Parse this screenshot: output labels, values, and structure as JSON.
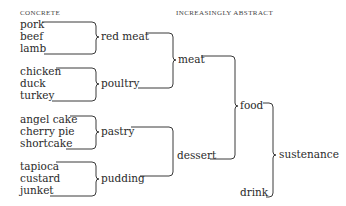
{
  "headers": {
    "left": "CONCRETE",
    "right": "INCREASINGLY ABSTRACT"
  },
  "level0": {
    "red_meat_items": [
      "pork",
      "beef",
      "lamb"
    ],
    "poultry_items": [
      "chicken",
      "duck",
      "turkey"
    ],
    "pastry_items": [
      "angel cake",
      "cherry pie",
      "shortcake"
    ],
    "pudding_items": [
      "tapioca",
      "custard",
      "junket"
    ]
  },
  "level1": {
    "red_meat": "red meat",
    "poultry": "poultry",
    "pastry": "pastry",
    "pudding": "pudding"
  },
  "level2": {
    "meat": "meat",
    "dessert": "dessert"
  },
  "level3": {
    "food": "food",
    "drink": "drink"
  },
  "level4": {
    "sustenance": "sustenance"
  },
  "colors": {
    "text": "#2a2a2a",
    "line": "#3a3a3a",
    "background": "#ffffff"
  }
}
